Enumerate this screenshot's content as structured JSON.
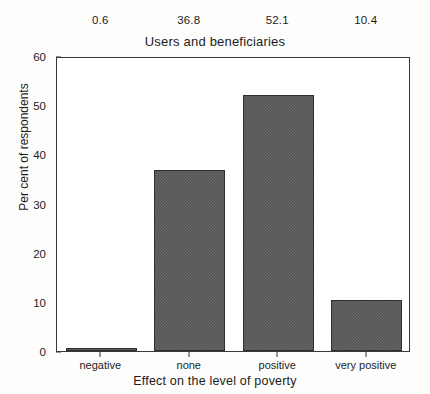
{
  "chart_data": {
    "type": "bar",
    "title": "Users and beneficiaries",
    "xlabel": "Effect on the level of poverty",
    "ylabel": "Per cent of respondents",
    "categories": [
      "negative",
      "none",
      "positive",
      "very positive"
    ],
    "values": [
      0.6,
      36.8,
      52.1,
      10.4
    ],
    "data_labels": [
      "0.6",
      "36.8",
      "52.1",
      "10.4"
    ],
    "ylim": [
      0,
      60
    ],
    "yticks": [
      0,
      10,
      20,
      30,
      40,
      50,
      60
    ],
    "ytick_labels": [
      "0",
      "10",
      "20",
      "30",
      "40",
      "50",
      "60"
    ],
    "grid": false,
    "legend": false,
    "bar_fill": "#545454",
    "bar_edge": "#2e2e2e",
    "axis_color": "#3a3a3a",
    "background": "#ffffff"
  }
}
